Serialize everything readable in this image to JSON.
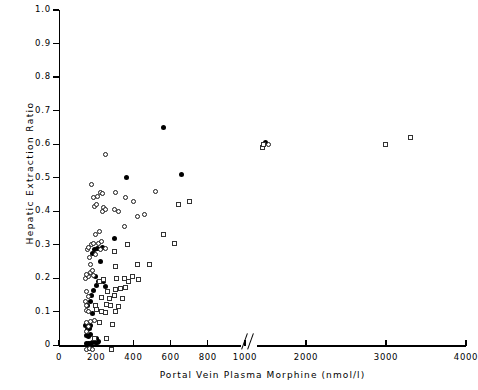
{
  "chart_data": {
    "type": "scatter",
    "title": "",
    "xlabel": "Portal Vein  Plasma Morphine  (nmol/l)",
    "ylabel": "Hepatic Extraction Ratio",
    "xlim": [
      0,
      4000
    ],
    "ylim": [
      0,
      1.0
    ],
    "grid": false,
    "legend": "none",
    "axis_break": {
      "after": 1000,
      "before": 2000,
      "symbol": "//"
    },
    "xticks": [
      0,
      200,
      400,
      600,
      800,
      1000,
      2000,
      3000,
      4000
    ],
    "xtick_labels": [
      "0",
      "200",
      "400",
      "600",
      "800",
      "1000",
      "2000",
      "3000",
      "4000"
    ],
    "yticks": [
      0,
      0.1,
      0.2,
      0.3,
      0.4,
      0.5,
      0.6,
      0.7,
      0.8,
      0.9,
      1.0
    ],
    "ytick_labels": [
      "0",
      "0.1",
      "0.2",
      "0.3",
      "0.4",
      "0.5",
      "0.6",
      "0.7",
      "0.8",
      "0.9",
      "1.0"
    ],
    "series": [
      {
        "name": "filled-circle",
        "marker": "filled-circle",
        "color": "#000000",
        "points": [
          [
            150,
            0.005
          ],
          [
            160,
            0.005
          ],
          [
            172,
            0.005
          ],
          [
            182,
            0.008
          ],
          [
            196,
            0.008
          ],
          [
            205,
            0.01
          ],
          [
            215,
            0.012
          ],
          [
            150,
            0.03
          ],
          [
            160,
            0.028
          ],
          [
            168,
            0.033
          ],
          [
            152,
            0.048
          ],
          [
            163,
            0.05
          ],
          [
            145,
            0.06
          ],
          [
            172,
            0.058
          ],
          [
            200,
            0.02
          ],
          [
            178,
            0.095
          ],
          [
            155,
            0.12
          ],
          [
            168,
            0.132
          ],
          [
            175,
            0.148
          ],
          [
            186,
            0.165
          ],
          [
            200,
            0.178
          ],
          [
            214,
            0.19
          ],
          [
            196,
            0.205
          ],
          [
            240,
            0.19
          ],
          [
            250,
            0.175
          ],
          [
            182,
            0.275
          ],
          [
            192,
            0.285
          ],
          [
            205,
            0.288
          ],
          [
            232,
            0.292
          ],
          [
            224,
            0.25
          ],
          [
            300,
            0.32
          ],
          [
            365,
            0.5
          ],
          [
            560,
            0.65
          ],
          [
            660,
            0.51
          ],
          [
            1490,
            0.605
          ]
        ]
      },
      {
        "name": "open-circle",
        "marker": "open-circle",
        "color": "#1a1a1a",
        "points": [
          [
            150,
            -0.012
          ],
          [
            165,
            -0.01
          ],
          [
            180,
            -0.012
          ],
          [
            150,
            0.042
          ],
          [
            158,
            0.055
          ],
          [
            146,
            0.068
          ],
          [
            168,
            0.07
          ],
          [
            192,
            0.075
          ],
          [
            150,
            0.105
          ],
          [
            160,
            0.1
          ],
          [
            148,
            0.118
          ],
          [
            142,
            0.13
          ],
          [
            160,
            0.145
          ],
          [
            150,
            0.16
          ],
          [
            140,
            0.2
          ],
          [
            158,
            0.205
          ],
          [
            146,
            0.212
          ],
          [
            168,
            0.218
          ],
          [
            178,
            0.222
          ],
          [
            188,
            0.208
          ],
          [
            170,
            0.24
          ],
          [
            162,
            0.262
          ],
          [
            152,
            0.285
          ],
          [
            160,
            0.292
          ],
          [
            175,
            0.3
          ],
          [
            186,
            0.305
          ],
          [
            196,
            0.27
          ],
          [
            210,
            0.305
          ],
          [
            222,
            0.286
          ],
          [
            230,
            0.31
          ],
          [
            250,
            0.29
          ],
          [
            196,
            0.33
          ],
          [
            216,
            0.34
          ],
          [
            236,
            0.398
          ],
          [
            240,
            0.412
          ],
          [
            252,
            0.405
          ],
          [
            190,
            0.415
          ],
          [
            200,
            0.42
          ],
          [
            186,
            0.44
          ],
          [
            205,
            0.445
          ],
          [
            300,
            0.405
          ],
          [
            320,
            0.4
          ],
          [
            350,
            0.355
          ],
          [
            176,
            0.48
          ],
          [
            225,
            0.455
          ],
          [
            232,
            0.452
          ],
          [
            250,
            0.57
          ],
          [
            305,
            0.455
          ],
          [
            360,
            0.44
          ],
          [
            400,
            0.43
          ],
          [
            420,
            0.385
          ],
          [
            460,
            0.39
          ],
          [
            520,
            0.46
          ],
          [
            1530,
            0.598
          ]
        ]
      },
      {
        "name": "open-square",
        "marker": "open-square",
        "color": "#333333",
        "points": [
          [
            282,
            -0.012
          ],
          [
            190,
            0.022
          ],
          [
            258,
            0.022
          ],
          [
            216,
            0.068
          ],
          [
            286,
            0.062
          ],
          [
            200,
            0.108
          ],
          [
            196,
            0.118
          ],
          [
            226,
            0.1
          ],
          [
            250,
            0.098
          ],
          [
            302,
            0.1
          ],
          [
            256,
            0.122
          ],
          [
            278,
            0.118
          ],
          [
            320,
            0.115
          ],
          [
            230,
            0.142
          ],
          [
            270,
            0.14
          ],
          [
            300,
            0.148
          ],
          [
            344,
            0.14
          ],
          [
            262,
            0.162
          ],
          [
            302,
            0.168
          ],
          [
            330,
            0.17
          ],
          [
            356,
            0.172
          ],
          [
            216,
            0.19
          ],
          [
            240,
            0.195
          ],
          [
            310,
            0.2
          ],
          [
            372,
            0.19
          ],
          [
            352,
            0.198
          ],
          [
            396,
            0.205
          ],
          [
            430,
            0.195
          ],
          [
            302,
            0.235
          ],
          [
            420,
            0.24
          ],
          [
            484,
            0.24
          ],
          [
            370,
            0.3
          ],
          [
            300,
            0.28
          ],
          [
            620,
            0.305
          ],
          [
            560,
            0.33
          ],
          [
            640,
            0.42
          ],
          [
            700,
            0.428
          ],
          [
            1450,
            0.59
          ],
          [
            1470,
            0.6
          ],
          [
            2990,
            0.6
          ],
          [
            3310,
            0.62
          ]
        ]
      }
    ]
  },
  "axis_titles": {
    "x": "Portal Vein  Plasma Morphine  (nmol/l)",
    "y": "Hepatic Extraction Ratio"
  }
}
